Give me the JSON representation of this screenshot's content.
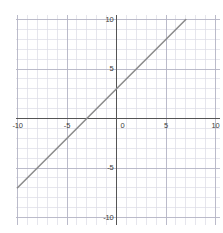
{
  "chart_data": {
    "type": "line",
    "title": "",
    "subtitle": "",
    "xlabel": "",
    "ylabel": "",
    "xlim": [
      -10.2,
      10.5
    ],
    "ylim": [
      -10.8,
      10.5
    ],
    "grid": true,
    "minor_grid": true,
    "minor_grid_step": 1,
    "major_grid_step": 5,
    "legend": "none",
    "x_ticks": [
      {
        "value": -10,
        "label": "-10"
      },
      {
        "value": -5,
        "label": "-5"
      },
      {
        "value": 0,
        "label": "0"
      },
      {
        "value": 5,
        "label": "5"
      },
      {
        "value": 10,
        "label": "10"
      }
    ],
    "y_ticks": [
      {
        "value": 10,
        "label": "10"
      },
      {
        "value": 5,
        "label": "5"
      },
      {
        "value": -5,
        "label": "-5"
      },
      {
        "value": -10,
        "label": "-10"
      }
    ],
    "series": [
      {
        "name": "line",
        "equation": "y = x + 3",
        "slope": 1,
        "intercept": 3,
        "x_intercept": -3,
        "y_intercept": 3,
        "points": [
          {
            "x": -10,
            "y": -7
          },
          {
            "x": 7,
            "y": 10
          }
        ],
        "color": "#8c8c8c",
        "width": 1.6
      }
    ],
    "colors": {
      "background": "#ffffff",
      "axis": "#555555",
      "major_grid": "#b4b4c4",
      "minor_grid": "#dcdce6",
      "tick_text": "#3c3c3c",
      "line": "#8c8c8c"
    }
  }
}
